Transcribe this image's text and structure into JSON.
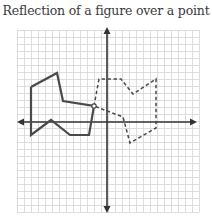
{
  "title": "Reflection of a figure over a point",
  "colors": {
    "grid": "#d4d4d4",
    "axis": "#333333",
    "figure": "#4a4a4a",
    "text": "#3a3a3a"
  },
  "grid": {
    "x_start": 17,
    "x_end": 199,
    "y_start": 30,
    "y_end": 212,
    "spacing": 7
  },
  "axes": {
    "x_axis_y": 122,
    "x_from": 17,
    "x_to": 197,
    "y_axis_x": 107,
    "y_from": 27,
    "y_to": 213
  },
  "original_figure": {
    "style": "solid",
    "points": [
      [
        31,
        87
      ],
      [
        57,
        73
      ],
      [
        63,
        101
      ],
      [
        94,
        106
      ],
      [
        89,
        135
      ],
      [
        70,
        135
      ],
      [
        51,
        120
      ],
      [
        31,
        135
      ],
      [
        31,
        87
      ]
    ]
  },
  "reflected_figure": {
    "style": "dashed",
    "points": [
      [
        94,
        106
      ],
      [
        99,
        79
      ],
      [
        121,
        79
      ],
      [
        133,
        94
      ],
      [
        156,
        79
      ],
      [
        156,
        128
      ],
      [
        130,
        143
      ],
      [
        123,
        117
      ],
      [
        94,
        106
      ]
    ]
  },
  "center_point": {
    "x": 94,
    "y": 106,
    "label": ""
  }
}
